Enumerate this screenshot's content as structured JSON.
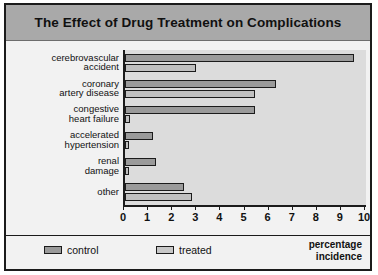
{
  "figure": {
    "title": "The Effect of Drug Treatment on Complications",
    "axis_title_line1": "percentage",
    "axis_title_line2": "incidence",
    "colors": {
      "title_band": "#a9a9a9",
      "plot_background": "#dcdcdc",
      "control_bar": "#9a9a9a",
      "treated_bar": "#c0c0c0",
      "frame": "#1b1b1b"
    }
  },
  "legend": {
    "items": [
      {
        "label": "control",
        "color": "#9a9a9a"
      },
      {
        "label": "treated",
        "color": "#c8c8c8"
      }
    ]
  },
  "chart_data": {
    "type": "bar",
    "orientation": "horizontal",
    "title": "The Effect of Drug Treatment on Complications",
    "xlabel": "percentage incidence",
    "ylabel": "",
    "xlim": [
      0,
      10
    ],
    "xticks": [
      0,
      1,
      2,
      3,
      4,
      5,
      6,
      7,
      8,
      9,
      10
    ],
    "xtick_labels": [
      "0",
      "1",
      "2",
      "3",
      "4",
      "5",
      "6",
      "7",
      "8",
      "9",
      "10"
    ],
    "grid": false,
    "legend_position": "bottom",
    "categories": [
      "cerebrovascular accident",
      "coronary artery disease",
      "congestive heart failure",
      "accelerated hypertension",
      "renal damage",
      "other"
    ],
    "category_label_lines": [
      [
        "cerebrovascular",
        "accident"
      ],
      [
        "coronary",
        "artery disease"
      ],
      [
        "congestive",
        "heart failure"
      ],
      [
        "accelerated",
        "hypertension"
      ],
      [
        "renal",
        "damage"
      ],
      [
        "other"
      ]
    ],
    "series": [
      {
        "name": "control",
        "values": [
          9.5,
          6.25,
          5.4,
          1.15,
          1.3,
          2.45
        ]
      },
      {
        "name": "treated",
        "values": [
          2.95,
          5.4,
          0.2,
          0.15,
          0.15,
          2.8
        ]
      }
    ]
  }
}
